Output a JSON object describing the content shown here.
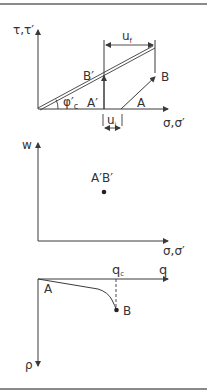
{
  "colors": {
    "stroke": "#3a3a3a",
    "text": "#333333",
    "frame": "#8a8a8a"
  },
  "panel_top": {
    "y_axis_label": "τ,τ′",
    "x_axis_label": "σ,σ′",
    "friction_angle_label": "φ′",
    "friction_angle_subscript": "c",
    "point_a_label": "A",
    "point_b_label": "B",
    "point_a_prime_label": "A′",
    "point_b_prime_label": "B′",
    "uf_label": "u",
    "uf_subscript": "f",
    "ui_label": "u",
    "ui_subscript": "i"
  },
  "panel_middle": {
    "y_axis_label": "w",
    "x_axis_label": "σ,σ′",
    "point_label": "A′B′"
  },
  "panel_bottom": {
    "x_axis_label": "q",
    "y_axis_label": "ρ",
    "qc_label": "q",
    "qc_subscript": "c",
    "point_a_label": "A",
    "point_b_label": "B"
  }
}
